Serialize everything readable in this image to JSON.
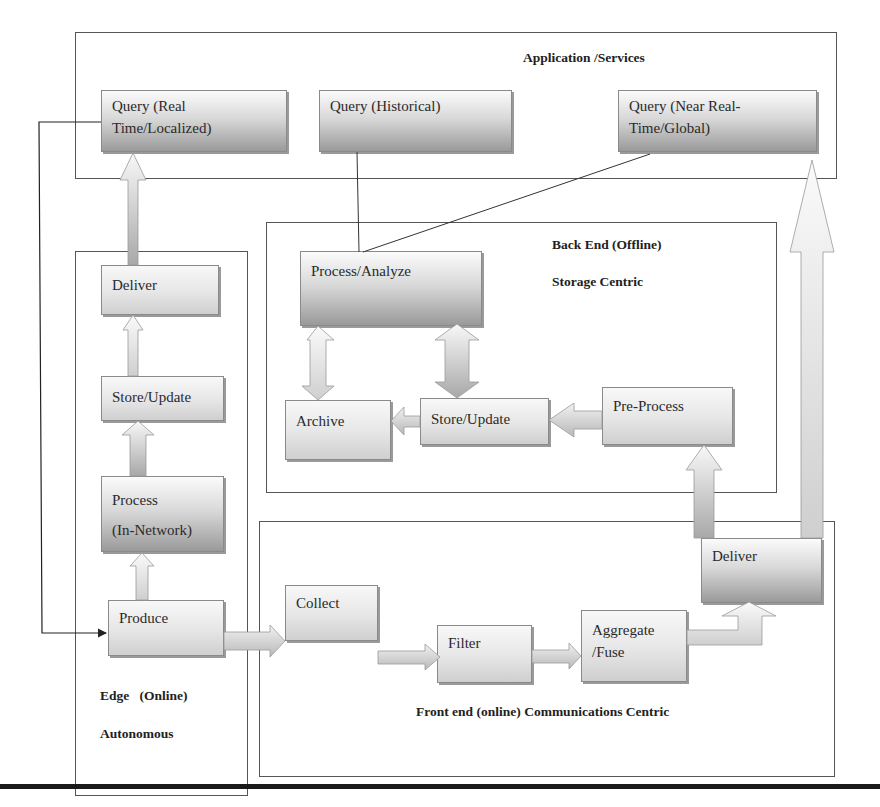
{
  "diagram": {
    "sections": {
      "application": {
        "title": "Application /Services"
      },
      "backend": {
        "title": "Back End (Offline)",
        "subtitle": "Storage Centric"
      },
      "edge": {
        "title": "Edge   (Online)",
        "subtitle": "Autonomous"
      },
      "frontend": {
        "title": "Front end (online) Communications Centric"
      }
    },
    "nodes": {
      "query_realtime": {
        "line1": "Query (Real",
        "line2": "Time/Localized)"
      },
      "query_historical": {
        "line1": "Query (Historical)"
      },
      "query_nearrealtime": {
        "line1": "Query (Near Real-",
        "line2": "Time/Global)"
      },
      "edge_deliver": {
        "label": "Deliver"
      },
      "edge_store_update": {
        "label": "Store/Update"
      },
      "edge_process": {
        "line1": "Process",
        "line2": "(In-Network)"
      },
      "edge_produce": {
        "label": "Produce"
      },
      "backend_process_analyze": {
        "label": "Process/Analyze"
      },
      "backend_archive": {
        "label": "Archive"
      },
      "backend_store_update": {
        "label": "Store/Update"
      },
      "backend_preprocess": {
        "label": "Pre-Process"
      },
      "front_collect": {
        "label": "Collect"
      },
      "front_filter": {
        "label": "Filter"
      },
      "front_aggregate": {
        "line1": "Aggregate",
        "line2": "/Fuse"
      },
      "front_deliver": {
        "label": "Deliver"
      }
    },
    "edges": [
      {
        "from": "Produce",
        "to": "Process (In-Network)",
        "type": "block-arrow"
      },
      {
        "from": "Process (In-Network)",
        "to": "Store/Update",
        "type": "block-arrow"
      },
      {
        "from": "Store/Update",
        "to": "Deliver",
        "type": "block-arrow"
      },
      {
        "from": "Deliver",
        "to": "Query (Real Time/Localized)",
        "type": "block-arrow"
      },
      {
        "from": "Query (Real Time/Localized)",
        "to": "Produce",
        "type": "line-arrow"
      },
      {
        "from": "Produce",
        "to": "Collect",
        "type": "block-arrow"
      },
      {
        "from": "Collect",
        "to": "Filter",
        "type": "block-arrow"
      },
      {
        "from": "Filter",
        "to": "Aggregate /Fuse",
        "type": "block-arrow"
      },
      {
        "from": "Aggregate /Fuse",
        "to": "Deliver (front)",
        "type": "block-arrow"
      },
      {
        "from": "Deliver (front)",
        "to": "Pre-Process",
        "type": "block-arrow"
      },
      {
        "from": "Deliver (front)",
        "to": "Query (Near Real-Time/Global)",
        "type": "block-arrow"
      },
      {
        "from": "Pre-Process",
        "to": "Store/Update (backend)",
        "type": "block-arrow"
      },
      {
        "from": "Store/Update (backend)",
        "to": "Archive",
        "type": "block-arrow"
      },
      {
        "from": "Process/Analyze",
        "to": "Archive",
        "type": "double-block-arrow"
      },
      {
        "from": "Process/Analyze",
        "to": "Store/Update (backend)",
        "type": "double-block-arrow"
      },
      {
        "from": "Process/Analyze",
        "to": "Query (Historical)",
        "type": "line"
      },
      {
        "from": "Process/Analyze",
        "to": "Query (Near Real-Time/Global)",
        "type": "line"
      }
    ]
  }
}
